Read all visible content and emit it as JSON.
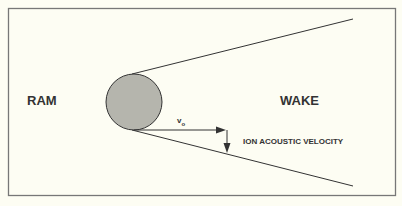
{
  "diagram": {
    "labels": {
      "ram": "RAM",
      "wake": "WAKE",
      "velocity_symbol": "v",
      "velocity_subscript": "o",
      "ion_acoustic": "ION ACOUSTIC VELOCITY"
    },
    "colors": {
      "background": "#fdfdf3",
      "frame": "#777777",
      "body_fill": "#b5b5ad",
      "line": "#333333"
    }
  }
}
